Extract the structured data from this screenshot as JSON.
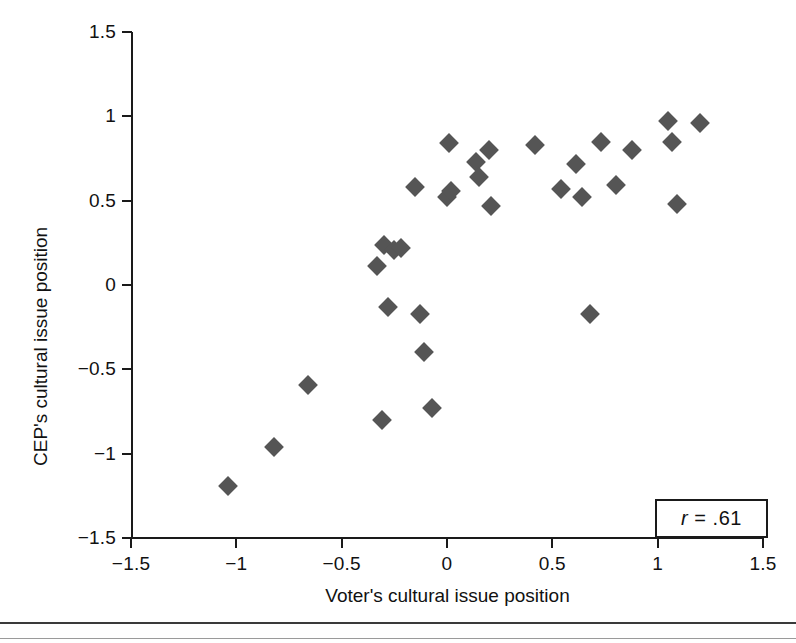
{
  "figure": {
    "background": "#ffffff",
    "marker_color": "#555555",
    "axis_color": "#1a1a1a"
  },
  "annotation": {
    "r_symbol": "r",
    "r_value": " = .61"
  },
  "chart_data": {
    "type": "scatter",
    "title": "",
    "xlabel": "Voter's cultural issue position",
    "ylabel": "CEP's cultural issue position",
    "xlim": [
      -1.5,
      1.5
    ],
    "ylim": [
      -1.5,
      1.5
    ],
    "xticks": [
      -1.5,
      -1,
      -0.5,
      0,
      0.5,
      1,
      1.5
    ],
    "xticklabels": [
      "−1.5",
      "−1",
      "−0.5",
      "0",
      "0.5",
      "1",
      "1.5"
    ],
    "yticks": [
      -1.5,
      -1,
      -0.5,
      0,
      0.5,
      1,
      1.5
    ],
    "yticklabels": [
      "−1.5",
      "−1",
      "−0.5",
      "0",
      "0.5",
      "1",
      "1.5"
    ],
    "grid": false,
    "legend": "none",
    "marker": "diamond",
    "annotations": [
      {
        "text": "r = .61",
        "position": "bottom-right",
        "boxed": true
      }
    ],
    "correlation": 0.61,
    "n_points": 31,
    "points": [
      {
        "x": -1.04,
        "y": -1.19
      },
      {
        "x": -0.82,
        "y": -0.96
      },
      {
        "x": -0.66,
        "y": -0.59
      },
      {
        "x": -0.31,
        "y": -0.8
      },
      {
        "x": -0.33,
        "y": 0.11
      },
      {
        "x": -0.3,
        "y": 0.24
      },
      {
        "x": -0.25,
        "y": 0.21
      },
      {
        "x": -0.22,
        "y": 0.22
      },
      {
        "x": -0.28,
        "y": -0.13
      },
      {
        "x": -0.15,
        "y": 0.58
      },
      {
        "x": -0.13,
        "y": -0.17
      },
      {
        "x": -0.11,
        "y": -0.4
      },
      {
        "x": -0.07,
        "y": -0.73
      },
      {
        "x": 0.01,
        "y": 0.84
      },
      {
        "x": 0.0,
        "y": 0.52
      },
      {
        "x": 0.02,
        "y": 0.56
      },
      {
        "x": 0.14,
        "y": 0.73
      },
      {
        "x": 0.15,
        "y": 0.64
      },
      {
        "x": 0.2,
        "y": 0.8
      },
      {
        "x": 0.21,
        "y": 0.47
      },
      {
        "x": 0.42,
        "y": 0.83
      },
      {
        "x": 0.54,
        "y": 0.57
      },
      {
        "x": 0.61,
        "y": 0.72
      },
      {
        "x": 0.64,
        "y": 0.52
      },
      {
        "x": 0.68,
        "y": -0.17
      },
      {
        "x": 0.73,
        "y": 0.85
      },
      {
        "x": 0.8,
        "y": 0.59
      },
      {
        "x": 0.88,
        "y": 0.8
      },
      {
        "x": 1.05,
        "y": 0.97
      },
      {
        "x": 1.07,
        "y": 0.85
      },
      {
        "x": 1.09,
        "y": 0.48
      },
      {
        "x": 1.2,
        "y": 0.96
      }
    ]
  }
}
